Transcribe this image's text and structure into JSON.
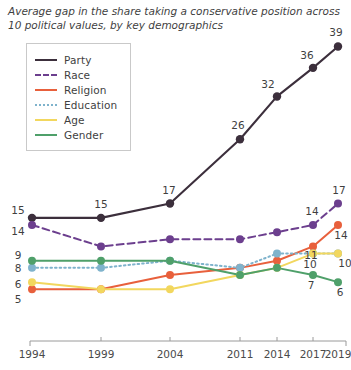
{
  "title": {
    "line1": "Average gap in the share taking a conservative position across",
    "line2": "10 political values, by key demographics"
  },
  "legend": {
    "position": "top-left",
    "items": [
      {
        "label": "Party",
        "color": "#3c2f3c",
        "style": "solid"
      },
      {
        "label": "Race",
        "color": "#6c3f8e",
        "style": "dashed"
      },
      {
        "label": "Religion",
        "color": "#e8603c",
        "style": "solid"
      },
      {
        "label": "Education",
        "color": "#7fb3cc",
        "style": "dotted"
      },
      {
        "label": "Age",
        "color": "#f2d75e",
        "style": "solid"
      },
      {
        "label": "Gender",
        "color": "#4fa06a",
        "style": "solid"
      }
    ]
  },
  "chart_data": {
    "type": "line",
    "title": "Average gap in the share taking a conservative position across 10 political values, by key demographics",
    "xlabel": "",
    "ylabel": "",
    "grid": false,
    "legend_position": "top-left",
    "categories": [
      "1994",
      "1999",
      "2004",
      "2011",
      "2014",
      "2017",
      "2019"
    ],
    "x_tick_labels": [
      "1994",
      "1999",
      "2004",
      "2011",
      "2014",
      "2017",
      "2019"
    ],
    "ylim": [
      0,
      42
    ],
    "series": [
      {
        "name": "Party",
        "color": "#3c2f3c",
        "style": "solid",
        "values": [
          15,
          15,
          17,
          26,
          32,
          36,
          39
        ],
        "point_labels": [
          "15",
          "15",
          "17",
          "26",
          "32",
          "36",
          "39"
        ]
      },
      {
        "name": "Race",
        "color": "#6c3f8e",
        "style": "dashed",
        "values": [
          14,
          11,
          12,
          12,
          13,
          14,
          17
        ],
        "point_labels": [
          "14",
          "",
          "",
          "",
          "",
          "14",
          "17"
        ]
      },
      {
        "name": "Religion",
        "color": "#e8603c",
        "style": "solid",
        "values": [
          5,
          5,
          7,
          8,
          9,
          11,
          14
        ],
        "point_labels": [
          "5",
          "",
          "",
          "",
          "",
          "11",
          "14"
        ]
      },
      {
        "name": "Education",
        "color": "#7fb3cc",
        "style": "dotted",
        "values": [
          8,
          8,
          9,
          8,
          10,
          10,
          10
        ],
        "point_labels": [
          "8",
          "",
          "",
          "",
          "",
          "",
          "10"
        ]
      },
      {
        "name": "Age",
        "color": "#f2d75e",
        "style": "solid",
        "values": [
          6,
          5,
          5,
          7,
          8,
          10,
          10
        ],
        "point_labels": [
          "6",
          "",
          "",
          "",
          "",
          "10",
          ""
        ]
      },
      {
        "name": "Gender",
        "color": "#4fa06a",
        "style": "solid",
        "values": [
          9,
          9,
          9,
          7,
          8,
          7,
          6
        ],
        "point_labels": [
          "9",
          "",
          "",
          "",
          "",
          "7",
          "6"
        ]
      }
    ]
  },
  "axis": {
    "line_color": "#9a9a9a",
    "tick_years": [
      "1994",
      "1999",
      "2004",
      "2011",
      "2014",
      "2017",
      "2019"
    ]
  }
}
